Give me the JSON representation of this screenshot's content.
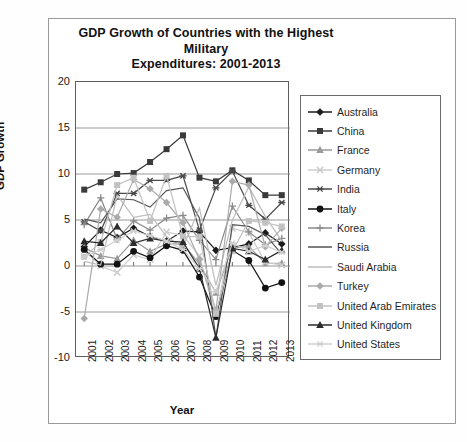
{
  "chart_data": {
    "type": "line",
    "title": "GDP Growth of Countries with the Highest Military Expenditures: 2001-2013",
    "title_line1": "GDP Growth of Countries with the Highest Military",
    "title_line2": "Expenditures: 2001-2013",
    "xlabel": "Year",
    "ylabel": "GDP Growth",
    "grid": true,
    "legend_position": "right",
    "ylim": [
      -10,
      20
    ],
    "yticks": [
      20,
      15,
      10,
      5,
      0,
      -5,
      -10
    ],
    "categories": [
      "2001",
      "2002",
      "2003",
      "2004",
      "2005",
      "2006",
      "2007",
      "2008",
      "2009",
      "2010",
      "2011",
      "2012",
      "2013"
    ],
    "series": [
      {
        "name": "Australia",
        "marker": "diamond",
        "color": "#1a1a1a",
        "values": [
          2.1,
          3.9,
          3.1,
          4.1,
          3.2,
          2.7,
          3.8,
          3.7,
          1.7,
          2.0,
          2.4,
          3.6,
          2.4
        ]
      },
      {
        "name": "China",
        "marker": "square",
        "color": "#3a3a3a",
        "values": [
          8.3,
          9.1,
          10.0,
          10.1,
          11.3,
          12.7,
          14.2,
          9.6,
          9.2,
          10.4,
          9.3,
          7.7,
          7.7
        ]
      },
      {
        "name": "France",
        "marker": "triangle",
        "color": "#9a9a9a",
        "values": [
          2.0,
          1.1,
          0.8,
          2.8,
          1.6,
          2.4,
          2.4,
          0.2,
          -2.9,
          2.0,
          2.1,
          0.3,
          0.3
        ]
      },
      {
        "name": "Germany",
        "marker": "x",
        "color": "#cccccc",
        "values": [
          1.7,
          0.0,
          -0.7,
          1.2,
          0.7,
          3.7,
          3.3,
          1.1,
          -5.6,
          4.1,
          3.6,
          0.4,
          0.1
        ]
      },
      {
        "name": "India",
        "marker": "asterisk",
        "color": "#4a4a4a",
        "values": [
          4.8,
          3.8,
          7.9,
          7.9,
          9.3,
          9.3,
          9.8,
          3.9,
          8.5,
          10.3,
          6.6,
          5.1,
          6.9
        ]
      },
      {
        "name": "Italy",
        "marker": "circle",
        "color": "#121212",
        "values": [
          1.8,
          0.2,
          0.2,
          1.6,
          0.9,
          2.2,
          1.7,
          -1.2,
          -5.5,
          1.7,
          0.6,
          -2.4,
          -1.8
        ]
      },
      {
        "name": "Korea",
        "marker": "plus",
        "color": "#8a8a8a",
        "values": [
          4.5,
          7.4,
          2.9,
          4.9,
          3.9,
          5.2,
          5.5,
          2.8,
          0.7,
          6.5,
          3.7,
          2.3,
          3.0
        ]
      },
      {
        "name": "Russia",
        "marker": "none",
        "color": "#555555",
        "values": [
          5.1,
          4.7,
          7.3,
          7.2,
          6.4,
          8.2,
          8.5,
          5.2,
          -7.8,
          4.5,
          4.3,
          3.4,
          1.3
        ]
      },
      {
        "name": "Saudi Arabia",
        "marker": "none",
        "color": "#bdbdbd",
        "values": [
          0.5,
          0.1,
          7.7,
          5.3,
          5.6,
          3.2,
          2.0,
          6.3,
          -2.1,
          5.0,
          8.6,
          5.4,
          2.7
        ]
      },
      {
        "name": "Turkey",
        "marker": "diamond",
        "color": "#aaaaaa",
        "values": [
          -5.7,
          6.2,
          5.3,
          9.4,
          8.4,
          6.9,
          4.7,
          0.7,
          -4.8,
          9.2,
          8.8,
          2.1,
          4.1
        ]
      },
      {
        "name": "United Arab Emirates",
        "marker": "square",
        "color": "#c2c2c2",
        "values": [
          1.0,
          2.6,
          8.8,
          9.6,
          4.9,
          9.8,
          3.2,
          3.2,
          -5.2,
          1.6,
          4.9,
          4.7,
          4.3
        ]
      },
      {
        "name": "United Kingdom",
        "marker": "triangle",
        "color": "#2b2b2b",
        "values": [
          2.7,
          2.5,
          4.3,
          2.5,
          3.0,
          2.7,
          2.6,
          -0.3,
          -7.8,
          1.9,
          1.6,
          0.7,
          1.7
        ]
      },
      {
        "name": "United States",
        "marker": "asterisk",
        "color": "#cfcfcf",
        "values": [
          1.0,
          1.8,
          2.8,
          3.8,
          3.3,
          2.7,
          1.8,
          -0.3,
          -2.8,
          2.5,
          1.6,
          2.2,
          1.5
        ]
      }
    ]
  }
}
